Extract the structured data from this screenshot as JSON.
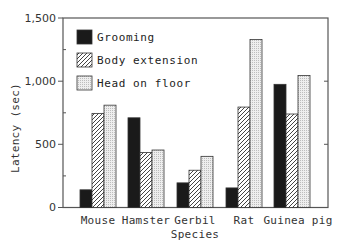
{
  "chart_data": {
    "type": "bar",
    "title": "",
    "xlabel": "Species",
    "ylabel": "Latency (sec)",
    "ylim": [
      0,
      1500
    ],
    "yticks": [
      0,
      500,
      1000,
      1500
    ],
    "ytick_labels": [
      "0",
      "500",
      "1,000",
      "1,500"
    ],
    "grid": false,
    "legend_position": "upper left",
    "categories": [
      "Mouse",
      "Hamster",
      "Gerbil",
      "Rat",
      "Guinea pig"
    ],
    "series": [
      {
        "name": "Grooming",
        "pattern": "solid-black",
        "values": [
          140,
          710,
          195,
          155,
          975
        ]
      },
      {
        "name": "Body extension",
        "pattern": "diagonal-hatch",
        "values": [
          745,
          435,
          295,
          795,
          740
        ]
      },
      {
        "name": "Head on floor",
        "pattern": "light-dotted",
        "values": [
          810,
          455,
          405,
          1330,
          1045
        ]
      }
    ]
  },
  "colors": {
    "grooming": "#1a1a1a",
    "hatch_line": "#444444",
    "dotted_fill": "#e4e4e4",
    "axis": "#555555"
  }
}
